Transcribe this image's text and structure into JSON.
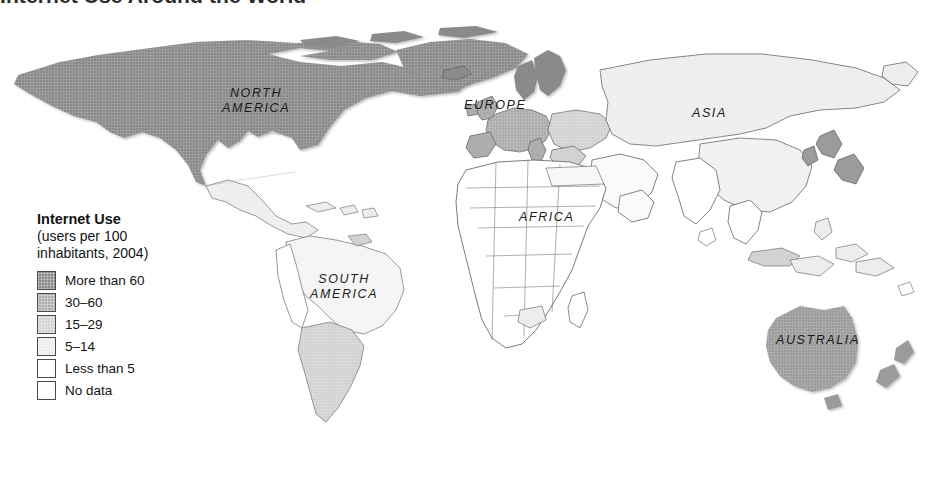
{
  "figure": {
    "title": "Internet Use Around the World"
  },
  "legend": {
    "title": "Internet Use",
    "subtitle": "(users per 100\ninhabitants, 2004)",
    "entries": [
      {
        "label": "More than 60",
        "color": "#8a8a8a",
        "hatched": true
      },
      {
        "label": "30–60",
        "color": "#adadad",
        "hatched": true
      },
      {
        "label": "15–29",
        "color": "#d2d2d2",
        "hatched": true
      },
      {
        "label": "5–14",
        "color": "#ededed",
        "hatched": true
      },
      {
        "label": "Less than 5",
        "color": "#ffffff",
        "hatched": false
      },
      {
        "label": "No data",
        "color": "#ffffff",
        "hatched": false
      }
    ]
  },
  "map": {
    "projection": "world",
    "background": "#ffffff",
    "border_color": "#5a5a5a",
    "labels": {
      "north_america": "NORTH\nAMERICA",
      "south_america": "SOUTH\nAMERICA",
      "europe": "EUROPE",
      "africa": "AFRICA",
      "asia": "ASIA",
      "australia": "AUSTRALIA"
    },
    "region_shading": [
      {
        "region": "North America (USA, Canada)",
        "class": "More than 60"
      },
      {
        "region": "Greenland",
        "class": "More than 60"
      },
      {
        "region": "Scandinavia",
        "class": "More than 60"
      },
      {
        "region": "Western Europe",
        "class": "30–60"
      },
      {
        "region": "Australia",
        "class": "30–60"
      },
      {
        "region": "New Zealand",
        "class": "30–60"
      },
      {
        "region": "Japan",
        "class": "30–60"
      },
      {
        "region": "South Korea",
        "class": "30–60"
      },
      {
        "region": "Eastern Europe",
        "class": "15–29"
      },
      {
        "region": "Chile / Argentina",
        "class": "15–29"
      },
      {
        "region": "Malaysia",
        "class": "15–29"
      },
      {
        "region": "Russia / Central Asia",
        "class": "5–14"
      },
      {
        "region": "Mexico / Brazil",
        "class": "5–14"
      },
      {
        "region": "China",
        "class": "5–14"
      },
      {
        "region": "South Asia",
        "class": "Less than 5"
      },
      {
        "region": "Most of Africa",
        "class": "Less than 5"
      }
    ]
  },
  "chart_data": {
    "type": "map",
    "title": "Internet Use Around the World",
    "units": "users per 100 inhabitants",
    "year": 2004,
    "classes": [
      {
        "label": "More than 60",
        "min": 60,
        "max": null,
        "color": "#8a8a8a"
      },
      {
        "label": "30–60",
        "min": 30,
        "max": 60,
        "color": "#adadad"
      },
      {
        "label": "15–29",
        "min": 15,
        "max": 29,
        "color": "#d2d2d2"
      },
      {
        "label": "5–14",
        "min": 5,
        "max": 14,
        "color": "#ededed"
      },
      {
        "label": "Less than 5",
        "min": 0,
        "max": 5,
        "color": "#ffffff"
      },
      {
        "label": "No data",
        "min": null,
        "max": null,
        "color": "#ffffff"
      }
    ]
  }
}
